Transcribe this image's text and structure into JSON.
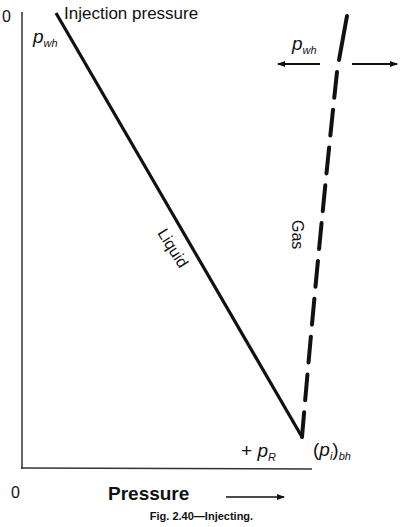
{
  "figure": {
    "title": "Injection pressure",
    "caption": "Fig. 2.40—Injecting.",
    "y_axis_origin": "0",
    "x_axis_origin": "0",
    "x_axis_title": "Pressure",
    "x_axis_arrow": "right-arrow",
    "labels": {
      "pwh_left": {
        "main": "p",
        "sub": "wh"
      },
      "pwh_right": {
        "main": "p",
        "sub": "wh"
      },
      "liquid": "Liquid",
      "gas": "Gas",
      "pr": {
        "prefix": "+ ",
        "main": "p",
        "sub": "R"
      },
      "pibh": {
        "open": "(",
        "main": "p",
        "inner_sub": "i",
        "close": ")",
        "sub": "bh"
      }
    },
    "curves": [
      {
        "name": "Liquid",
        "style": "solid",
        "from": [
          56,
          13
        ],
        "to": [
          302,
          437
        ]
      },
      {
        "name": "Gas",
        "style": "dashed",
        "from": [
          347,
          16
        ],
        "to": [
          302,
          437
        ]
      }
    ],
    "arrows": [
      {
        "name": "left-arrow",
        "direction": "left"
      },
      {
        "name": "right-arrow",
        "direction": "right"
      }
    ],
    "colors": {
      "ink": "#111111",
      "axis": "#333333",
      "background": "#ffffff"
    }
  }
}
